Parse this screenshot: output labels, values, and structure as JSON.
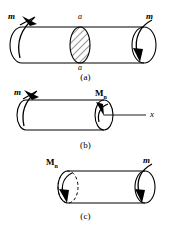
{
  "figure": {
    "line_color": "#000000",
    "hatch_color": "#000000",
    "background": "#ffffff"
  },
  "panels": [
    {
      "id": "a",
      "caption": "(a)",
      "labels": {
        "torque_left": "m",
        "torque_right": "m",
        "section_top": "a",
        "section_bottom": "a"
      }
    },
    {
      "id": "b",
      "caption": "(b)",
      "labels": {
        "torque_left": "m",
        "internal_moment": "M",
        "internal_moment_sub": "n",
        "axis": "x"
      }
    },
    {
      "id": "c",
      "caption": "(c)",
      "labels": {
        "internal_moment": "M",
        "internal_moment_sub": "n",
        "torque_right": "m"
      }
    }
  ]
}
